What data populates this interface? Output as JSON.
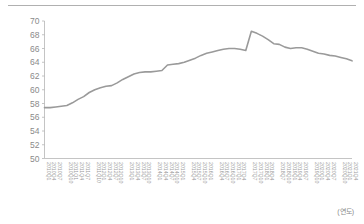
{
  "chart_data": {
    "type": "line",
    "title": "",
    "xlabel": "(연도)",
    "ylabel": "",
    "ylim": [
      50,
      70
    ],
    "ytick_values": [
      50,
      52,
      54,
      56,
      58,
      60,
      62,
      64,
      66,
      68,
      70
    ],
    "grid": false,
    "legend": null,
    "series_color": "#9a9a9a",
    "categories": [
      "2010Q1",
      "2010Q4",
      "2010Q7",
      "2010Q10",
      "2011Q1",
      "2011Q4",
      "2011Q7",
      "2011Q10",
      "2012Q1",
      "2012Q4",
      "2012Q7",
      "2012Q10",
      "2013Q1",
      "2013Q4",
      "2013Q7",
      "2013Q10",
      "2014Q1",
      "2014Q4",
      "2014Q7",
      "2014Q10",
      "2015Q1",
      "2015Q4",
      "2015Q7",
      "2015Q10",
      "2016Q1",
      "2016Q4",
      "2016Q7",
      "2016Q10",
      "2017Q1",
      "2017Q4",
      "2017Q7",
      "2017Q10",
      "2018Q1",
      "2018Q4",
      "2018Q7",
      "2018Q10",
      "2019Q1",
      "2019Q4",
      "2019Q7",
      "2019Q10",
      "2020Q1",
      "2020Q4",
      "2020Q7",
      "2020Q10",
      "2021Q1",
      "2021Q4"
    ],
    "values": [
      57.4,
      57.4,
      57.5,
      57.6,
      57.7,
      58.1,
      58.6,
      59.0,
      59.6,
      60.0,
      60.3,
      60.5,
      60.6,
      61.0,
      61.5,
      61.9,
      62.3,
      62.5,
      62.6,
      62.6,
      62.7,
      62.8,
      63.6,
      63.7,
      63.8,
      64.0,
      64.3,
      64.6,
      65.0,
      65.3,
      65.5,
      65.7,
      65.9,
      66.0,
      66.0,
      65.9,
      65.7,
      68.5,
      68.2,
      67.8,
      67.3,
      66.7,
      66.6,
      66.2,
      66.0,
      66.1
    ],
    "annotations": [
      {
        "label": "series-start",
        "value": 57.4
      },
      {
        "label": "series-peak",
        "value": 68.5
      },
      {
        "label": "series-end",
        "value": 64.2
      }
    ],
    "tail_values": [
      66.1,
      65.9,
      65.6,
      65.3,
      65.2,
      65.0,
      64.9,
      64.7,
      64.5,
      64.2
    ]
  },
  "unit": {
    "xaxis_unit_label": "(연도)"
  }
}
